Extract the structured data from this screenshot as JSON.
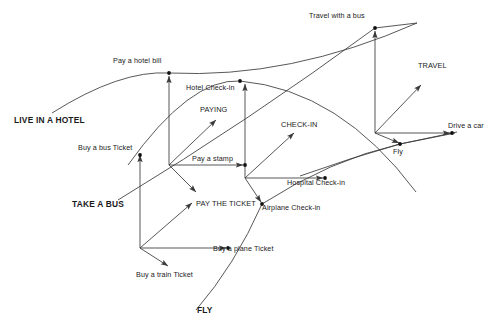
{
  "diagram": {
    "type": "node-link-analogy",
    "background": "#ffffff",
    "line_color": "#3a3a3a",
    "text_color": "#1a1a1a",
    "width": 500,
    "height": 335
  },
  "labels": {
    "live_in_a_hotel": "LIVE IN A HOTEL",
    "take_a_bus": "TAKE A BUS",
    "fly": "FLY",
    "pay_a_hotel_bill": "Pay a hotel bill",
    "hotel_check_in": "Hotel Check-in",
    "paying": "PAYING",
    "pay_a_stamp": "Pay a stamp",
    "pay_the_ticket": "PAY THE TICKET",
    "buy_a_bus_ticket": "Buy a bus Ticket",
    "buy_a_train_ticket": "Buy a train Ticket",
    "buy_a_plane_ticket": "Buy a plane Ticket",
    "check_in": "CHECK-IN",
    "airplane_check_in": "Airplane Check-in",
    "hospital_check_in": "Hospital Check-in",
    "travel_with_a_bus": "Travel with a bus",
    "travel": "TRAVEL",
    "drive_a_car": "Drive a car",
    "fly_node": "Fly"
  },
  "nodes": [
    {
      "id": "hub-bus",
      "label": "",
      "x": 140,
      "y": 248,
      "kind": "hub",
      "dot": false
    },
    {
      "id": "hub-pay",
      "label": "",
      "x": 169,
      "y": 165,
      "kind": "hub",
      "dot": false
    },
    {
      "id": "hub-checkin",
      "label": "",
      "x": 245,
      "y": 178,
      "kind": "hub",
      "dot": false
    },
    {
      "id": "hub-travel",
      "label": "",
      "x": 375,
      "y": 133,
      "kind": "hub",
      "dot": false
    },
    {
      "id": "n-hotel-bill",
      "label": "Pay a hotel bill",
      "x": 169,
      "y": 73,
      "kind": "concept",
      "dot": true
    },
    {
      "id": "n-hotel-ci",
      "label": "Hotel Check-in",
      "x": 240,
      "y": 81,
      "kind": "concept",
      "dot": true
    },
    {
      "id": "n-paying",
      "label": "PAYING",
      "x": 215,
      "y": 113,
      "kind": "abstract",
      "dot": false
    },
    {
      "id": "n-stamp",
      "label": "Pay a stamp",
      "x": 245,
      "y": 165,
      "kind": "concept",
      "dot": true
    },
    {
      "id": "n-pay-ticket",
      "label": "PAY THE TICKET",
      "x": 196,
      "y": 205,
      "kind": "abstract",
      "dot": false
    },
    {
      "id": "n-bus-ticket",
      "label": "Buy a bus Ticket",
      "x": 140,
      "y": 155,
      "kind": "concept",
      "dot": true
    },
    {
      "id": "n-train-ticket",
      "label": "Buy a train Ticket",
      "x": 185,
      "y": 267,
      "kind": "concept",
      "dot": false
    },
    {
      "id": "n-plane-ticket",
      "label": "Buy a plane Ticket",
      "x": 228,
      "y": 248,
      "kind": "concept",
      "dot": true
    },
    {
      "id": "n-check-in",
      "label": "CHECK-IN",
      "x": 298,
      "y": 127,
      "kind": "abstract",
      "dot": false
    },
    {
      "id": "n-airplane-ci",
      "label": "Airplane Check-in",
      "x": 262,
      "y": 204,
      "kind": "concept",
      "dot": true
    },
    {
      "id": "n-hospital-ci",
      "label": "Hospital Check-in",
      "x": 325,
      "y": 178,
      "kind": "concept",
      "dot": true
    },
    {
      "id": "n-travel-bus",
      "label": "Travel with a bus",
      "x": 375,
      "y": 28,
      "kind": "concept",
      "dot": true
    },
    {
      "id": "n-travel",
      "label": "TRAVEL",
      "x": 423,
      "y": 77,
      "kind": "abstract",
      "dot": false
    },
    {
      "id": "n-drive-car",
      "label": "Drive a car",
      "x": 452,
      "y": 133,
      "kind": "concept",
      "dot": true
    },
    {
      "id": "n-fly",
      "label": "Fly",
      "x": 400,
      "y": 144,
      "kind": "concept",
      "dot": true
    }
  ],
  "arrows": [
    {
      "from": "hub-bus",
      "to": "n-bus-ticket",
      "x1": 140,
      "y1": 248,
      "x2": 140,
      "y2": 155
    },
    {
      "from": "hub-bus",
      "to": "n-pay-ticket",
      "x1": 140,
      "y1": 248,
      "x2": 192,
      "y2": 203
    },
    {
      "from": "hub-bus",
      "to": "n-plane-ticket",
      "x1": 140,
      "y1": 248,
      "x2": 226,
      "y2": 248
    },
    {
      "from": "hub-bus",
      "to": "n-train-ticket",
      "x1": 140,
      "y1": 248,
      "x2": 168,
      "y2": 266
    },
    {
      "from": "hub-pay",
      "to": "n-hotel-bill",
      "x1": 169,
      "y1": 165,
      "x2": 169,
      "y2": 76
    },
    {
      "from": "hub-pay",
      "to": "n-paying",
      "x1": 169,
      "y1": 165,
      "x2": 216,
      "y2": 120
    },
    {
      "from": "hub-pay",
      "to": "n-stamp",
      "x1": 169,
      "y1": 165,
      "x2": 243,
      "y2": 165
    },
    {
      "from": "hub-pay",
      "to": "n-pay-ticket-d",
      "x1": 169,
      "y1": 165,
      "x2": 196,
      "y2": 192
    },
    {
      "from": "hub-checkin",
      "to": "n-hotel-ci",
      "x1": 245,
      "y1": 178,
      "x2": 245,
      "y2": 84
    },
    {
      "from": "hub-checkin",
      "to": "n-check-in",
      "x1": 245,
      "y1": 178,
      "x2": 294,
      "y2": 133
    },
    {
      "from": "hub-checkin",
      "to": "n-hospital-ci",
      "x1": 245,
      "y1": 178,
      "x2": 323,
      "y2": 178
    },
    {
      "from": "hub-checkin",
      "to": "n-airplane-ci",
      "x1": 245,
      "y1": 178,
      "x2": 261,
      "y2": 202
    },
    {
      "from": "hub-travel",
      "to": "n-travel-bus",
      "x1": 375,
      "y1": 133,
      "x2": 375,
      "y2": 31
    },
    {
      "from": "hub-travel",
      "to": "n-travel",
      "x1": 375,
      "y1": 133,
      "x2": 421,
      "y2": 85
    },
    {
      "from": "hub-travel",
      "to": "n-drive-car",
      "x1": 375,
      "y1": 133,
      "x2": 450,
      "y2": 133
    },
    {
      "from": "hub-travel",
      "to": "n-fly",
      "x1": 375,
      "y1": 133,
      "x2": 399,
      "y2": 143
    }
  ],
  "arcs": [
    {
      "id": "arc-hotel-bill",
      "desc": "LIVE IN A HOTEL through Pay a hotel bill to right edge",
      "d": "M 52,113 Q 120,70 169,73 Q 290,79 417,23"
    },
    {
      "id": "arc-hotel-checkin",
      "desc": "through Hotel Check-in descending right",
      "d": "M 128,165 Q 190,78 240,81 Q 340,90 416,192"
    },
    {
      "id": "arc-travel-bus",
      "desc": "rising arc through Travel with a bus",
      "d": "M 118,200 Q 250,120 375,28 L 417,23"
    },
    {
      "id": "arc-plane",
      "desc": "through Buy a plane Ticket and Airplane Check-in to Fly",
      "d": "M 196,310 Q 235,265 262,204 Q 330,160 400,144 L 455,133"
    },
    {
      "id": "arc-fly-lower",
      "desc": "lower arc through Fly to the right",
      "d": "M 300,176 Q 350,158 400,144 L 457,132"
    }
  ],
  "bold_labels": [
    {
      "text": "LIVE IN A HOTEL",
      "x": 14,
      "y": 116
    },
    {
      "text": "TAKE A BUS",
      "x": 72,
      "y": 200
    },
    {
      "text": "FLY",
      "x": 197,
      "y": 306
    }
  ]
}
